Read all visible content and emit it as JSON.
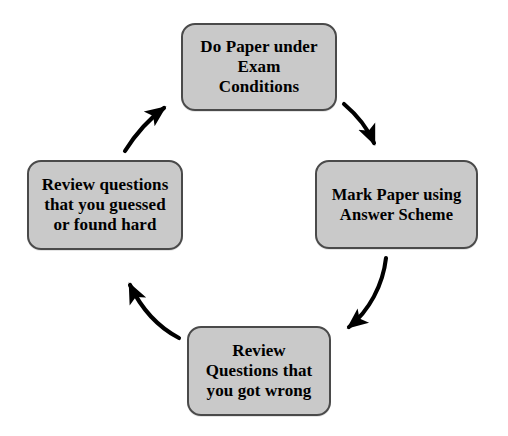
{
  "diagram": {
    "type": "cycle-flowchart",
    "title": "",
    "background_color": "#ffffff",
    "node_fill_color": "#c9c9c9",
    "node_border_color": "#4a4a4a",
    "text_color": "#000000",
    "arrow_color": "#000000",
    "direction": "clockwise",
    "nodes": [
      {
        "id": "do-paper",
        "label": "Do Paper under\nExam\nConditions",
        "position": "top"
      },
      {
        "id": "mark-paper",
        "label": "Mark Paper using\nAnswer Scheme",
        "position": "right"
      },
      {
        "id": "review-wrong",
        "label": "Review\nQuestions that\nyou got wrong",
        "position": "bottom"
      },
      {
        "id": "review-guessed",
        "label": "Review questions\nthat you guessed\nor found hard",
        "position": "left"
      }
    ],
    "arrows": [
      {
        "id": "arrow-top-to-right",
        "from": "do-paper",
        "to": "mark-paper",
        "label": ""
      },
      {
        "id": "arrow-right-to-bottom",
        "from": "mark-paper",
        "to": "review-wrong",
        "label": ""
      },
      {
        "id": "arrow-bottom-to-left",
        "from": "review-wrong",
        "to": "review-guessed",
        "label": ""
      },
      {
        "id": "arrow-left-to-top",
        "from": "review-guessed",
        "to": "do-paper",
        "label": ""
      }
    ]
  }
}
